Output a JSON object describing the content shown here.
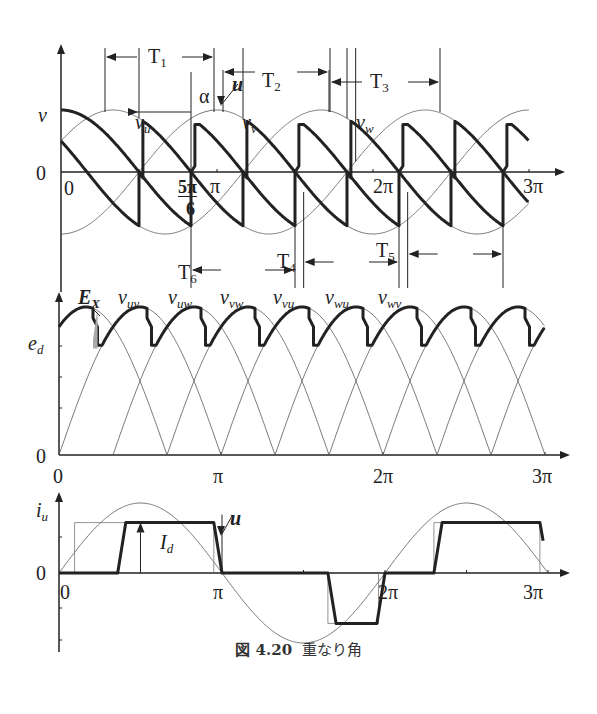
{
  "caption": {
    "number": "図 4.20",
    "title": "重なり角"
  },
  "chart_data": [
    {
      "type": "line",
      "title": "Phase voltages with overlap angle",
      "ylabel": "v",
      "xlabel": "",
      "x_ticks": [
        "0",
        "5π/6",
        "π",
        "2π",
        "3π"
      ],
      "series": [
        {
          "name": "v_u",
          "label": "v_u"
        },
        {
          "name": "v_v",
          "label": "v_v"
        },
        {
          "name": "v_w",
          "label": "v_w"
        }
      ],
      "annotations": [
        "α",
        "u",
        "T1",
        "T2",
        "T3",
        "T4",
        "T5",
        "T6"
      ],
      "firing_angle_alpha": "5π/6 → π/6 after crossing",
      "overlap_angle": "u"
    },
    {
      "type": "line",
      "title": "DC output voltage e_d",
      "ylabel": "e_d",
      "x_ticks": [
        "0",
        "π",
        "2π",
        "3π"
      ],
      "series_labels": [
        "v_uv",
        "v_uw",
        "v_vw",
        "v_vu",
        "v_wu",
        "v_wv"
      ],
      "annotations": [
        "E_X"
      ]
    },
    {
      "type": "line",
      "title": "Phase current i_u",
      "ylabel": "i_u",
      "x_ticks": [
        "0",
        "π",
        "2π",
        "3π"
      ],
      "annotations": [
        "I_d",
        "u"
      ],
      "y_zero_label": "0"
    }
  ],
  "labels": {
    "p1": {
      "v": "v",
      "zero": "0",
      "x0": "0",
      "fivepi": "5π",
      "six": "6",
      "pi": "π",
      "twopi": "2π",
      "threepi": "3π",
      "vu": "v",
      "vu_sub": "u",
      "vv": "v",
      "vv_sub": "v",
      "vw": "v",
      "vw_sub": "w",
      "alpha": "α",
      "u": "u",
      "T1": "T",
      "T1s": "1",
      "T2": "T",
      "T2s": "2",
      "T3": "T",
      "T3s": "3",
      "T4": "T",
      "T4s": "4",
      "T5": "T",
      "T5s": "5",
      "T6": "T",
      "T6s": "6"
    },
    "p2": {
      "ed": "e",
      "ed_sub": "d",
      "zero": "0",
      "x0": "0",
      "pi": "π",
      "twopi": "2π",
      "threepi": "3π",
      "Ex": "E",
      "Ex_sub": "X",
      "vuv": "v",
      "vuv_s": "uv",
      "vuw": "v",
      "vuw_s": "uw",
      "vvw": "v",
      "vvw_s": "vw",
      "vvu": "v",
      "vvu_s": "vu",
      "vwu": "v",
      "vwu_s": "wu",
      "vwv": "v",
      "vwv_s": "wv"
    },
    "p3": {
      "iu": "i",
      "iu_sub": "u",
      "zero": "0",
      "x0": "0",
      "pi": "π",
      "twopi": "2π",
      "threepi": "3π",
      "Id": "I",
      "Id_sub": "d",
      "u": "u"
    }
  }
}
